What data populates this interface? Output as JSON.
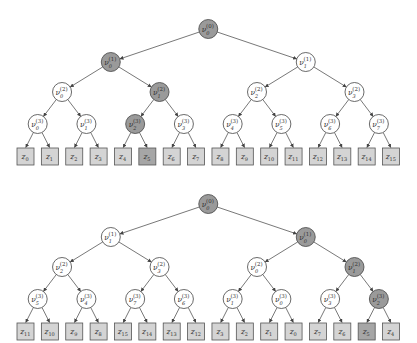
{
  "colors": {
    "node_fill": "#ffffff",
    "node_highlight": "#9a9a9a",
    "leaf_fill": "#d4d4d4",
    "leaf_highlight": "#a6a6a6",
    "edge": "#555555"
  },
  "node_symbol": "ν",
  "leaf_symbol": "z",
  "trees": [
    {
      "name": "top-tree",
      "root_y": 29,
      "levels": [
        [
          {
            "sub": "0",
            "sup": "(0)",
            "hl": true
          }
        ],
        [
          {
            "sub": "0",
            "sup": "(1)",
            "hl": true
          },
          {
            "sub": "1",
            "sup": "(1)",
            "hl": false
          }
        ],
        [
          {
            "sub": "0",
            "sup": "(2)",
            "hl": false
          },
          {
            "sub": "1",
            "sup": "(2)",
            "hl": true
          },
          {
            "sub": "2",
            "sup": "(2)",
            "hl": false
          },
          {
            "sub": "3",
            "sup": "(2)",
            "hl": false
          }
        ],
        [
          {
            "sub": "0",
            "sup": "(3)",
            "hl": false
          },
          {
            "sub": "1",
            "sup": "(3)",
            "hl": false
          },
          {
            "sub": "2",
            "sup": "(3)",
            "hl": true
          },
          {
            "sub": "3",
            "sup": "(3)",
            "hl": false
          },
          {
            "sub": "4",
            "sup": "(3)",
            "hl": false
          },
          {
            "sub": "5",
            "sup": "(3)",
            "hl": false
          },
          {
            "sub": "6",
            "sup": "(3)",
            "hl": false
          },
          {
            "sub": "7",
            "sup": "(3)",
            "hl": false
          }
        ]
      ],
      "leaves": [
        {
          "sub": "0",
          "hl": false
        },
        {
          "sub": "1",
          "hl": false
        },
        {
          "sub": "2",
          "hl": false
        },
        {
          "sub": "3",
          "hl": false
        },
        {
          "sub": "4",
          "hl": false
        },
        {
          "sub": "5",
          "hl": true
        },
        {
          "sub": "6",
          "hl": false
        },
        {
          "sub": "7",
          "hl": false
        },
        {
          "sub": "8",
          "hl": false
        },
        {
          "sub": "9",
          "hl": false
        },
        {
          "sub": "10",
          "hl": false
        },
        {
          "sub": "11",
          "hl": false
        },
        {
          "sub": "12",
          "hl": false
        },
        {
          "sub": "13",
          "hl": false
        },
        {
          "sub": "14",
          "hl": false
        },
        {
          "sub": "15",
          "hl": false
        }
      ]
    },
    {
      "name": "bottom-tree",
      "root_y": 204,
      "levels": [
        [
          {
            "sub": "0",
            "sup": "(0)",
            "hl": true
          }
        ],
        [
          {
            "sub": "1",
            "sup": "(1)",
            "hl": false
          },
          {
            "sub": "0",
            "sup": "(1)",
            "hl": true
          }
        ],
        [
          {
            "sub": "2",
            "sup": "(2)",
            "hl": false
          },
          {
            "sub": "3",
            "sup": "(2)",
            "hl": false
          },
          {
            "sub": "0",
            "sup": "(2)",
            "hl": false
          },
          {
            "sub": "1",
            "sup": "(2)",
            "hl": true
          }
        ],
        [
          {
            "sub": "5",
            "sup": "(3)",
            "hl": false
          },
          {
            "sub": "4",
            "sup": "(3)",
            "hl": false
          },
          {
            "sub": "7",
            "sup": "(3)",
            "hl": false
          },
          {
            "sub": "6",
            "sup": "(3)",
            "hl": false
          },
          {
            "sub": "1",
            "sup": "(3)",
            "hl": false
          },
          {
            "sub": "0",
            "sup": "(3)",
            "hl": false
          },
          {
            "sub": "3",
            "sup": "(3)",
            "hl": false
          },
          {
            "sub": "2",
            "sup": "(3)",
            "hl": true
          }
        ]
      ],
      "leaves": [
        {
          "sub": "11",
          "hl": false
        },
        {
          "sub": "10",
          "hl": false
        },
        {
          "sub": "9",
          "hl": false
        },
        {
          "sub": "8",
          "hl": false
        },
        {
          "sub": "15",
          "hl": false
        },
        {
          "sub": "14",
          "hl": false
        },
        {
          "sub": "13",
          "hl": false
        },
        {
          "sub": "12",
          "hl": false
        },
        {
          "sub": "3",
          "hl": false
        },
        {
          "sub": "2",
          "hl": false
        },
        {
          "sub": "1",
          "hl": false
        },
        {
          "sub": "0",
          "hl": false
        },
        {
          "sub": "7",
          "hl": false
        },
        {
          "sub": "6",
          "hl": false
        },
        {
          "sub": "5",
          "hl": true
        },
        {
          "sub": "4",
          "hl": false
        }
      ]
    }
  ]
}
